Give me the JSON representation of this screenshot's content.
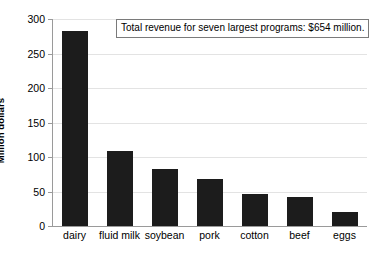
{
  "chart_data": {
    "type": "bar",
    "title": "",
    "subtitle": "",
    "xlabel": "",
    "ylabel": "Million dollars",
    "categories": [
      "dairy",
      "fluid milk",
      "soybean",
      "pork",
      "cotton",
      "beef",
      "eggs"
    ],
    "values": [
      283,
      109,
      83,
      68,
      47,
      42,
      21
    ],
    "ylim": [
      0,
      300
    ],
    "ytick_step": 50,
    "yticks": [
      0,
      50,
      100,
      150,
      200,
      250,
      300
    ],
    "ytick_labels": [
      "0",
      "50",
      "100",
      "150",
      "200",
      "250",
      "300"
    ],
    "grid": true,
    "grid_axis": "y",
    "legend": false,
    "legend_position": "none",
    "bar_color": "#1c1c1c",
    "grid_color": "#e3e3e3",
    "axis_color": "#9a9a9a",
    "background_color": "#ffffff",
    "annotations": [
      {
        "name": "total-revenue-note",
        "text": "Total revenue for seven largest programs: $654 million.",
        "boxed": true,
        "position": "top-right"
      }
    ]
  }
}
